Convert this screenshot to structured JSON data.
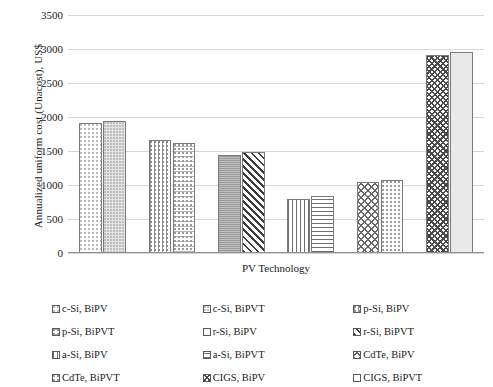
{
  "chart_data": {
    "type": "bar",
    "title": "",
    "xlabel": "PV Technology",
    "ylabel": "Annualized uniform cost (Unacost), US$",
    "ylim": [
      0,
      3500
    ],
    "ytick_labels": [
      "0",
      "500",
      "1000",
      "1500",
      "2000",
      "2500",
      "3000",
      "3500"
    ],
    "ytick_values": [
      0,
      500,
      1000,
      1500,
      2000,
      2500,
      3000,
      3500
    ],
    "grid": true,
    "legend_position": "bottom",
    "categories": [
      "c-Si, BiPV",
      "c-Si, BiPVT",
      "p-Si, BiPV",
      "p-Si, BiPVT",
      "r-Si, BiPV",
      "r-Si, BiPVT",
      "a-Si, BiPV",
      "a-Si, BiPVT",
      "CdTe, BiPV",
      "CdTe, BiPVT",
      "CIGS, BiPV",
      "CIGS, BiPVT"
    ],
    "values": [
      1912,
      1941,
      1662,
      1618,
      1441,
      1485,
      794,
      838,
      1044,
      1074,
      2912,
      2956
    ],
    "bars": [
      {
        "label": "c-Si, BiPV",
        "value": 1912,
        "group": 0,
        "pattern": "dots-light"
      },
      {
        "label": "c-Si, BiPVT",
        "value": 1941,
        "group": 0,
        "pattern": "dots-dense"
      },
      {
        "label": "p-Si, BiPV",
        "value": 1662,
        "group": 1,
        "pattern": "dots-vgrid"
      },
      {
        "label": "p-Si, BiPVT",
        "value": 1618,
        "group": 1,
        "pattern": "dots-hgrid"
      },
      {
        "label": "r-Si, BiPV",
        "value": 1441,
        "group": 2,
        "pattern": "solid-grey"
      },
      {
        "label": "r-Si, BiPVT",
        "value": 1485,
        "group": 2,
        "pattern": "diag-dark"
      },
      {
        "label": "a-Si, BiPV",
        "value": 794,
        "group": 3,
        "pattern": "vlines"
      },
      {
        "label": "a-Si, BiPVT",
        "value": 838,
        "group": 3,
        "pattern": "hlines"
      },
      {
        "label": "CdTe, BiPV",
        "value": 1044,
        "group": 4,
        "pattern": "crosshatch"
      },
      {
        "label": "CdTe, BiPVT",
        "value": 1074,
        "group": 4,
        "pattern": "dots-med"
      },
      {
        "label": "CIGS, BiPV",
        "value": 2912,
        "group": 5,
        "pattern": "diagcross-dark"
      },
      {
        "label": "CIGS, BiPVT",
        "value": 2956,
        "group": 5,
        "pattern": "flat-light"
      }
    ],
    "legend": [
      {
        "label": "c-Si, BiPV",
        "pattern": "dots-light"
      },
      {
        "label": "c-Si, BiPVT",
        "pattern": "dots-dense"
      },
      {
        "label": "p-Si, BiPV",
        "pattern": "dots-vgrid"
      },
      {
        "label": "p-Si, BiPVT",
        "pattern": "dots-hgrid"
      },
      {
        "label": "r-Si, BiPV",
        "pattern": "solid-grey"
      },
      {
        "label": "r-Si, BiPVT",
        "pattern": "diag-dark"
      },
      {
        "label": "a-Si, BiPV",
        "pattern": "vlines"
      },
      {
        "label": "a-Si, BiPVT",
        "pattern": "hlines"
      },
      {
        "label": "CdTe, BiPV",
        "pattern": "crosshatch"
      },
      {
        "label": "CdTe, BiPVT",
        "pattern": "dots-med"
      },
      {
        "label": "CIGS, BiPV",
        "pattern": "diagcross-dark"
      },
      {
        "label": "CIGS, BiPVT",
        "pattern": "flat-light"
      }
    ],
    "colors": {
      "gridline": "#d6d6d6",
      "axis": "#8f8f8f",
      "text": "#1a1a1a",
      "bar_outline": "#7a7a7a",
      "background": "#ffffff"
    }
  }
}
